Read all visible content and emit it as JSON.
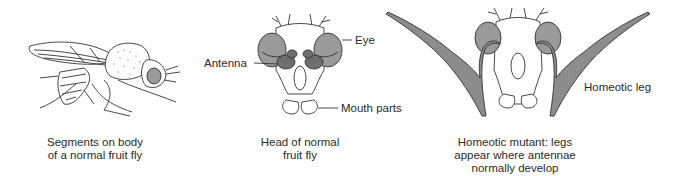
{
  "panels": [
    {
      "id": "normal-fly-body",
      "caption_lines": [
        "Segments on body",
        "of a normal fruit fly"
      ]
    },
    {
      "id": "normal-fly-head",
      "caption_lines": [
        "Head of normal",
        "fruit fly"
      ],
      "labels": {
        "eye": "Eye",
        "antenna": "Antenna",
        "mouth_parts": "Mouth parts"
      }
    },
    {
      "id": "homeotic-mutant-head",
      "caption_lines": [
        "Homeotic mutant: legs",
        "appear where antennae",
        "normally develop"
      ],
      "labels": {
        "homeotic_leg": "Homeotic leg"
      }
    }
  ],
  "colors": {
    "line": "#333333",
    "eye_fill": "#9a9a9a",
    "antenna_fill": "#6e6e6e",
    "leg_fill": "#8c8c8c"
  }
}
